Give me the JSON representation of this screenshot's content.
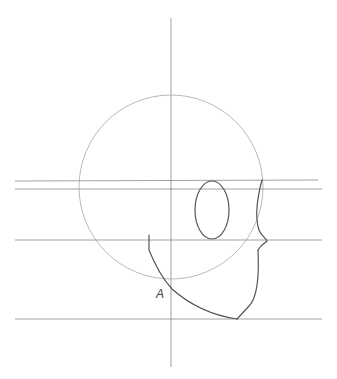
{
  "drawing": {
    "title": "Head side-view construction sketch",
    "labels": [
      {
        "id": "point-a",
        "text": "A",
        "x": 160,
        "y": 297
      }
    ],
    "colors": {
      "background": "#ffffff",
      "guide": "#8a8a8a",
      "circle": "#a8a8a8",
      "ink": "#555555"
    },
    "cranium_circle": {
      "cx": 171,
      "cy": 187,
      "r": 92
    },
    "vertical_axis": {
      "x": 171,
      "y1": 18,
      "y2": 367
    },
    "horizontal_guides": [
      {
        "name": "brow-line-top",
        "y": 181
      },
      {
        "name": "brow-line-bottom",
        "y": 189
      },
      {
        "name": "nose-line",
        "y": 240
      },
      {
        "name": "chin-line",
        "y": 319
      }
    ]
  }
}
